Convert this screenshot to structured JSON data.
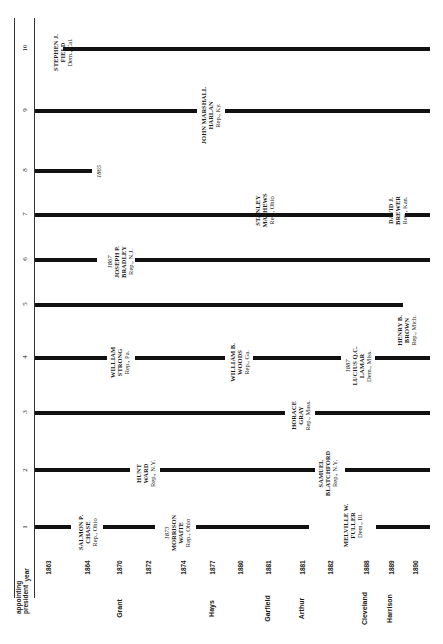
{
  "header": {
    "appointing_label": "appointing",
    "president_label": "president",
    "year_label": "year"
  },
  "seats": [
    "1",
    "2",
    "3",
    "4",
    "5",
    "6",
    "7",
    "8",
    "9",
    "10"
  ],
  "years": [
    "1863",
    "1864",
    "1870",
    "1872",
    "1874",
    "1877",
    "1880",
    "1881",
    "1881",
    "1882",
    "1888",
    "1889",
    "1890"
  ],
  "presidents": [
    "Grant",
    "Hays",
    "Garfield",
    "Arthur",
    "Cleveland",
    "Harrison"
  ],
  "justices": {
    "field": {
      "name1": "STEPHEN J.",
      "name2": "FIELD",
      "party": "Dem., Cal."
    },
    "harlan": {
      "name1": "JOHN MARSHALL",
      "name2": "HARLAN",
      "party": "Rep., Ky."
    },
    "seat8_end": "1865",
    "matthews": {
      "name1": "STANLEY",
      "name2": "MATHEWS",
      "party": "Rep., Ohio"
    },
    "brewer": {
      "name1": "DAVID J.",
      "name2": "BREWER",
      "party": "Rep., Kan."
    },
    "bradley": {
      "year": "1867",
      "name1": "JOSEPH P.",
      "name2": "BRADLEY",
      "party": "Rep., N.J."
    },
    "brown": {
      "name1": "HENRY B.",
      "name2": "BROWN",
      "party": "Rep., Mich."
    },
    "strong": {
      "name1": "WILLIAM",
      "name2": "STRONG",
      "party": "Rep., Pa."
    },
    "woods": {
      "name1": "WILLIAM B.",
      "name2": "WOODS",
      "party": "Rep., Ga."
    },
    "lamar": {
      "year": "1887",
      "name1": "LUCIUS Q.C.",
      "name2": "LAMAR",
      "party": "Dem., Miss."
    },
    "gray": {
      "name1": "HORACE",
      "name2": "GRAY",
      "party": "Rep., Mass."
    },
    "hunt": {
      "name1": "HUNT",
      "name2": "WARD",
      "party": "Rep., N.Y."
    },
    "blatchford": {
      "name1": "SAMUEL",
      "name2": "BLATCHFORD",
      "party": "Rep., N.Y."
    },
    "chase": {
      "name1": "SALMON P.",
      "name2": "CHASE",
      "party": "Rep., Ohio"
    },
    "waite": {
      "year": "1873",
      "name1": "MORRISON",
      "name2": "WAITE",
      "party": "Rep., Ohio"
    },
    "fuller": {
      "name1": "MELVILLE W.",
      "name2": "FULLER",
      "party": "Dem., Ill."
    }
  },
  "colors": {
    "line": "#111111",
    "text": "#1a1a1a",
    "background": "#ffffff"
  }
}
